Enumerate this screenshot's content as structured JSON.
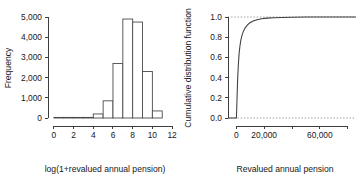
{
  "figure": {
    "background": "#ffffff",
    "ink": "#3d3d3d"
  },
  "chart_data": [
    {
      "type": "bar",
      "panel": "left",
      "title": "",
      "xlabel": "log(1+revalued annual pension)",
      "ylabel": "Frequency",
      "xlim": [
        -0.6,
        12.4
      ],
      "ylim": [
        0,
        5000
      ],
      "grid": false,
      "legend": null,
      "xticks": [
        0,
        2,
        4,
        6,
        8,
        10,
        12
      ],
      "xticklabels": [
        "0",
        "2",
        "4",
        "6",
        "8",
        "10",
        "12"
      ],
      "yticks": [
        0,
        1000,
        2000,
        3000,
        4000,
        5000
      ],
      "yticklabels": [
        "0",
        "1,000",
        "2,000",
        "3,000",
        "4,000",
        "5,000"
      ],
      "bin_width": 1,
      "bin_edges": [
        0,
        1,
        2,
        3,
        4,
        5,
        6,
        7,
        8,
        9,
        10,
        11
      ],
      "categories": [
        "0-1",
        "1-2",
        "2-3",
        "3-4",
        "4-5",
        "5-6",
        "6-7",
        "7-8",
        "8-9",
        "9-10",
        "10-11"
      ],
      "values": [
        20,
        10,
        10,
        15,
        200,
        850,
        2700,
        4900,
        4750,
        2300,
        350
      ]
    },
    {
      "type": "line",
      "panel": "right",
      "title": "",
      "xlabel": "Revalued annual pension",
      "ylabel": "Cumulative distribution function",
      "xlim": [
        -6000,
        86000
      ],
      "ylim": [
        0,
        1.0
      ],
      "grid": false,
      "legend": null,
      "xticks": [
        0,
        20000,
        40000,
        60000,
        80000
      ],
      "xticklabels": [
        "0",
        "20,000",
        "",
        "60,000",
        ""
      ],
      "yticks": [
        0.0,
        0.2,
        0.4,
        0.6,
        0.8,
        1.0
      ],
      "yticklabels": [
        "0.0",
        "0.2",
        "0.4",
        "0.6",
        "0.8",
        "1.0"
      ],
      "reference_lines": [
        {
          "name": "zero-reference",
          "y": 0.0,
          "style": "dotted"
        },
        {
          "name": "one-reference",
          "y": 1.0,
          "style": "dotted"
        }
      ],
      "x": [
        -6000,
        0,
        200,
        500,
        900,
        1400,
        2000,
        2600,
        3300,
        4200,
        5200,
        6500,
        8000,
        10000,
        12500,
        15000,
        18000,
        22000,
        27000,
        33000,
        40000,
        50000,
        62000,
        74000,
        86000
      ],
      "y": [
        0.0,
        0.0,
        0.06,
        0.2,
        0.37,
        0.52,
        0.64,
        0.715,
        0.775,
        0.825,
        0.862,
        0.895,
        0.922,
        0.945,
        0.962,
        0.973,
        0.982,
        0.989,
        0.993,
        0.996,
        0.998,
        0.999,
        0.9995,
        1.0,
        1.0
      ]
    }
  ]
}
